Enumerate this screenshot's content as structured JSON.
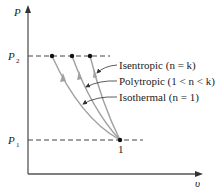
{
  "diagram": {
    "type": "P-v diagram",
    "axes": {
      "y_label": "P",
      "x_label": "υ"
    },
    "pressure_levels": [
      {
        "label": "P",
        "subscript": "2"
      },
      {
        "label": "P",
        "subscript": "1"
      }
    ],
    "state_point": {
      "label": "1"
    },
    "processes": [
      {
        "name": "Isentropic",
        "condition": "(n = k)",
        "full": "Isentropic (n = k)"
      },
      {
        "name": "Polytropic",
        "condition": "(1 < n < k)",
        "full": "Polytropic (1 < n < k)"
      },
      {
        "name": "Isothermal",
        "condition": "(n = 1)",
        "full": "Isothermal (n = 1)"
      }
    ],
    "colors": {
      "axis": "#555555",
      "curve": "#a0a0a0",
      "dashed": "#444444",
      "point": "#111111"
    }
  }
}
